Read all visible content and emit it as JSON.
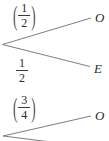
{
  "diagram": {
    "type": "probability-tree",
    "colors": {
      "line": "#6e6e6e",
      "text": "#2b2b2b"
    },
    "tree1": {
      "top_branch": {
        "label": {
          "left_paren": "(",
          "numerator": "1",
          "denominator": "2",
          "right_paren": ")"
        },
        "outcome": "O"
      },
      "bottom_branch": {
        "label": {
          "numerator": "1",
          "denominator": "2"
        },
        "outcome": "E"
      }
    },
    "tree2": {
      "top_branch": {
        "label": {
          "left_paren": "(",
          "numerator": "3",
          "denominator": "4",
          "right_paren": ")"
        },
        "outcome": "O"
      },
      "bottom_branch": {
        "note": "cut off at image edge"
      }
    }
  }
}
